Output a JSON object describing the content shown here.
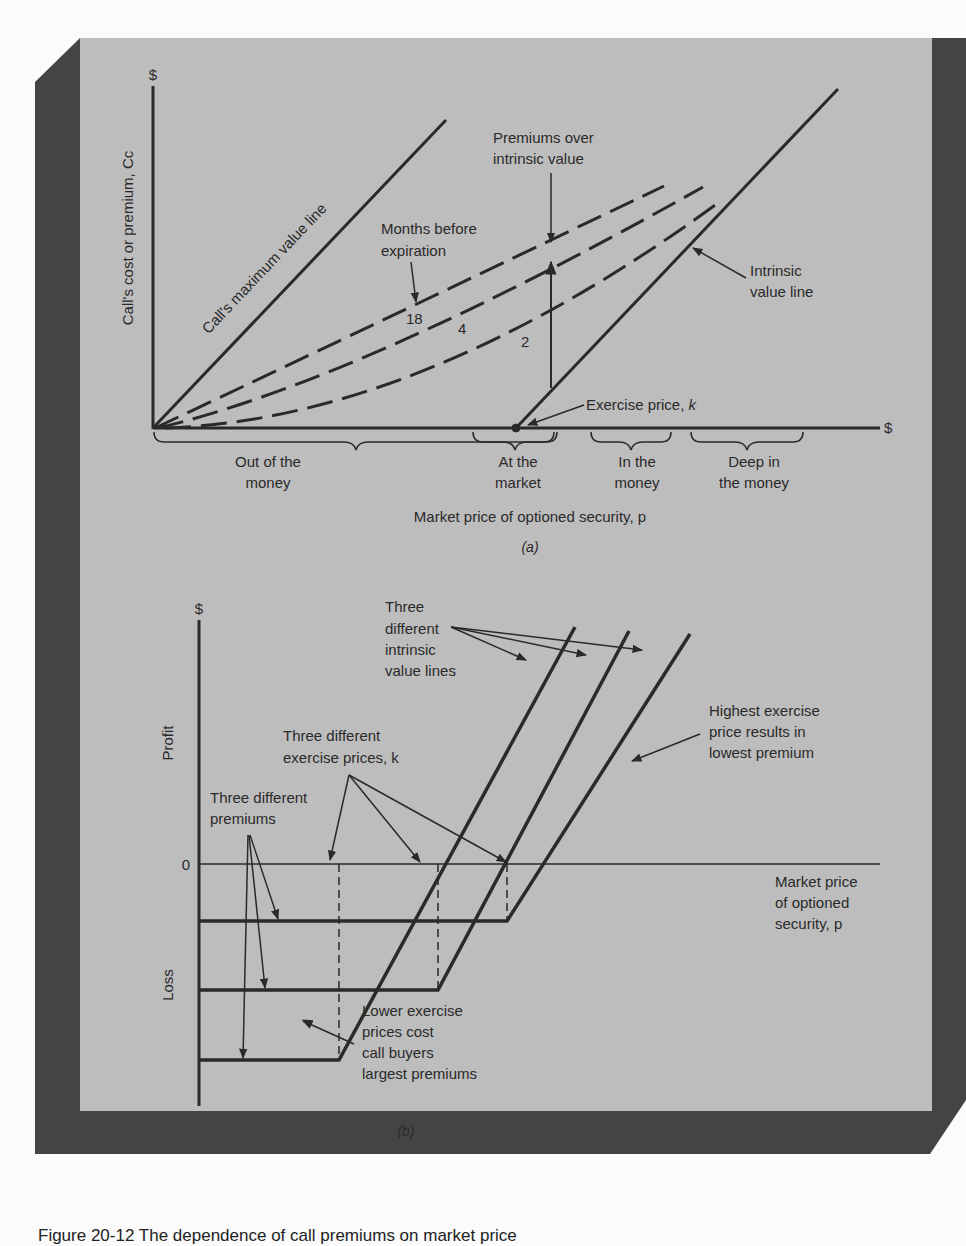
{
  "colors": {
    "page_bg": "#fbfbfb",
    "panel_bg": "#bdbdbd",
    "shadow": "#444444",
    "ink": "#2a2a2a"
  },
  "panel_a": {
    "label": "(a)",
    "y_axis_symbol": "$",
    "x_axis_symbol": "$",
    "y_axis_title": "Call's cost or premium, Cc",
    "x_axis_title": "Market price of optioned security, p",
    "max_value_line_label": "Call's maximum value line",
    "months_label_line1": "Months before",
    "months_label_line2": "expiration",
    "curve_labels": [
      "18",
      "4",
      "2"
    ],
    "premiums_label_line1": "Premiums over",
    "premiums_label_line2": "intrinsic value",
    "intrinsic_label_line1": "Intrinsic",
    "intrinsic_label_line2": "value line",
    "exercise_label": "Exercise price, ",
    "exercise_symbol": "k",
    "regions": [
      {
        "line1": "Out of the",
        "line2": "money"
      },
      {
        "line1": "At the",
        "line2": "market"
      },
      {
        "line1": "In the",
        "line2": "money"
      },
      {
        "line1": "Deep in",
        "line2": "the money"
      }
    ]
  },
  "panel_b": {
    "label": "(b)",
    "y_axis_symbol": "$",
    "zero_label": "0",
    "profit_label": "Profit",
    "loss_label": "Loss",
    "x_axis_title_line1": "Market price",
    "x_axis_title_line2": "of optioned",
    "x_axis_title_line3": "security, p",
    "intrinsic_label": [
      "Three",
      "different",
      "intrinsic",
      "value lines"
    ],
    "exercise_label_line1": "Three different",
    "exercise_label_line2": "exercise prices, k",
    "premiums_label_line1": "Three different",
    "premiums_label_line2": "premiums",
    "highest_label": [
      "Highest exercise",
      "price results in",
      "lowest premium"
    ],
    "lower_label": [
      "Lower exercise",
      "prices cost",
      "call buyers",
      "largest premiums"
    ]
  },
  "caption": "Figure 20-12 The dependence of call premiums on market price"
}
